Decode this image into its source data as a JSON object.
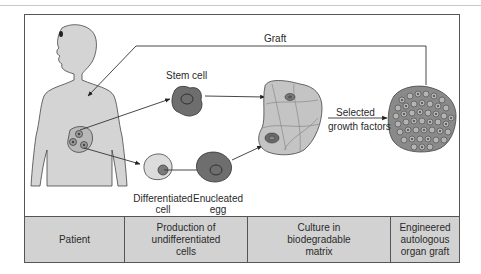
{
  "diagram": {
    "labels": {
      "graft": "Graft",
      "stem_cell": "Stem cell",
      "differentiated_cell": "Differentiated\ncell",
      "enucleated_egg": "Enucleated\negg",
      "selected_growth_factors_1": "Selected",
      "selected_growth_factors_2": "growth factors"
    },
    "nodes": [
      {
        "id": "patient",
        "shape": "human-torso-silhouette",
        "color": "#d4d4d4"
      },
      {
        "id": "stem-cell",
        "shape": "cell",
        "color": "#6e6e6e"
      },
      {
        "id": "differentiated-cell",
        "shape": "cell",
        "color": "#d9d9d9"
      },
      {
        "id": "enucleated-egg",
        "shape": "cell",
        "color": "#6e6e6e"
      },
      {
        "id": "biodegradable-matrix",
        "shape": "scaffold",
        "color": "#c4c4c4"
      },
      {
        "id": "organ-graft",
        "shape": "cell-cluster",
        "color": "#8a8a8a"
      }
    ],
    "edges": [
      {
        "from": "patient",
        "to": "stem-cell"
      },
      {
        "from": "patient",
        "to": "differentiated-cell"
      },
      {
        "from": "differentiated-cell",
        "to": "enucleated-egg"
      },
      {
        "from": "stem-cell",
        "to": "biodegradable-matrix"
      },
      {
        "from": "enucleated-egg",
        "to": "biodegradable-matrix"
      },
      {
        "from": "biodegradable-matrix",
        "to": "organ-graft",
        "label": "Selected growth factors"
      },
      {
        "from": "organ-graft",
        "to": "patient",
        "label": "Graft"
      }
    ],
    "stages": [
      {
        "label": "Patient"
      },
      {
        "label": "Production of\nundifferentiated\ncells"
      },
      {
        "label": "Culture in\nbiodegradable\nmatrix"
      },
      {
        "label": "Engineered\nautologous\norgan graft"
      }
    ]
  }
}
